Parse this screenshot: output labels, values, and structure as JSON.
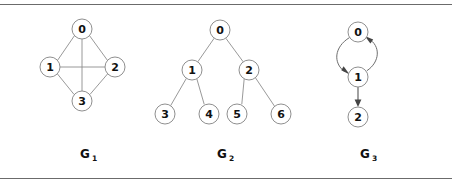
{
  "figure": {
    "title": "",
    "background": "#ffffff",
    "width": 452,
    "height": 184,
    "rules": {
      "top_y": 4,
      "bottom_y": 178,
      "color": "#6b6b6b"
    }
  },
  "colors": {
    "edge": "#8d8d8d",
    "arc": "#6e6e6e",
    "arrow": "#555555",
    "node_stroke": "#8f8f8f",
    "node_fill": "#ffffff",
    "label_text": "#111111",
    "rule": "#6b6b6b"
  },
  "graphs": [
    {
      "id": "g1",
      "caption_base": "G",
      "caption_sub": "1",
      "caption_x": 85,
      "caption_y": 158,
      "directed": false,
      "node_radius": 10,
      "nodes": [
        {
          "id": "0",
          "label": "0",
          "cx": 82,
          "cy": 29
        },
        {
          "id": "1",
          "label": "1",
          "cx": 50,
          "cy": 67
        },
        {
          "id": "2",
          "label": "2",
          "cx": 115,
          "cy": 67
        },
        {
          "id": "3",
          "label": "3",
          "cx": 82,
          "cy": 101
        }
      ],
      "edges": [
        {
          "from": "0",
          "to": "1"
        },
        {
          "from": "0",
          "to": "2"
        },
        {
          "from": "0",
          "to": "3"
        },
        {
          "from": "1",
          "to": "2"
        },
        {
          "from": "1",
          "to": "3"
        },
        {
          "from": "2",
          "to": "3"
        }
      ]
    },
    {
      "id": "g2",
      "caption_base": "G",
      "caption_sub": "2",
      "caption_x": 222,
      "caption_y": 158,
      "directed": false,
      "node_radius": 10,
      "nodes": [
        {
          "id": "0",
          "label": "0",
          "cx": 220,
          "cy": 30
        },
        {
          "id": "1",
          "label": "1",
          "cx": 192,
          "cy": 70
        },
        {
          "id": "2",
          "label": "2",
          "cx": 249,
          "cy": 70
        },
        {
          "id": "3",
          "label": "3",
          "cx": 165,
          "cy": 114
        },
        {
          "id": "4",
          "label": "4",
          "cx": 209,
          "cy": 114
        },
        {
          "id": "5",
          "label": "5",
          "cx": 237,
          "cy": 114
        },
        {
          "id": "6",
          "label": "6",
          "cx": 281,
          "cy": 114
        }
      ],
      "edges": [
        {
          "from": "0",
          "to": "1"
        },
        {
          "from": "0",
          "to": "2"
        },
        {
          "from": "1",
          "to": "3"
        },
        {
          "from": "1",
          "to": "4"
        },
        {
          "from": "2",
          "to": "5"
        },
        {
          "from": "2",
          "to": "6"
        }
      ]
    },
    {
      "id": "g3",
      "caption_base": "G",
      "caption_sub": "3",
      "caption_x": 365,
      "caption_y": 158,
      "directed": true,
      "node_radius": 10,
      "nodes": [
        {
          "id": "0",
          "label": "0",
          "cx": 358,
          "cy": 32
        },
        {
          "id": "1",
          "label": "1",
          "cx": 358,
          "cy": 77
        },
        {
          "id": "2",
          "label": "2",
          "cx": 358,
          "cy": 117
        }
      ],
      "edges": [
        {
          "from": "0",
          "to": "1",
          "style": "curve-left"
        },
        {
          "from": "1",
          "to": "0",
          "style": "curve-right"
        },
        {
          "from": "1",
          "to": "2",
          "style": "straight"
        }
      ]
    }
  ]
}
